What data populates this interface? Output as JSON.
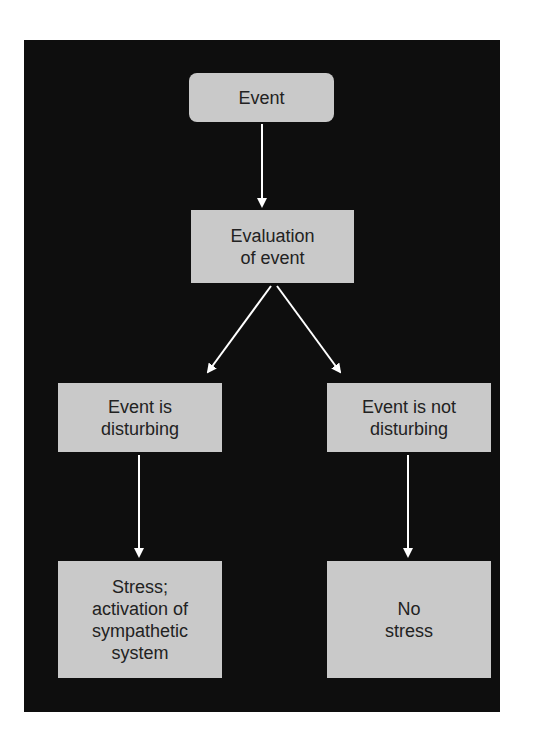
{
  "diagram": {
    "type": "flowchart",
    "nodes": [
      {
        "id": "event",
        "label": "Event"
      },
      {
        "id": "evaluation",
        "label": "Evaluation\nof event"
      },
      {
        "id": "disturbing",
        "label": "Event is\ndisturbing"
      },
      {
        "id": "not_disturbing",
        "label": "Event is not\ndisturbing"
      },
      {
        "id": "stress",
        "label": "Stress;\nactivation of\nsympathetic\nsystem"
      },
      {
        "id": "no_stress",
        "label": "No\nstress"
      }
    ],
    "edges": [
      {
        "from": "event",
        "to": "evaluation"
      },
      {
        "from": "evaluation",
        "to": "disturbing"
      },
      {
        "from": "evaluation",
        "to": "not_disturbing"
      },
      {
        "from": "disturbing",
        "to": "stress"
      },
      {
        "from": "not_disturbing",
        "to": "no_stress"
      }
    ],
    "colors": {
      "background": "#0e0e0e",
      "box": "#c9c9c9",
      "arrow": "#ffffff",
      "text": "#222222"
    }
  }
}
